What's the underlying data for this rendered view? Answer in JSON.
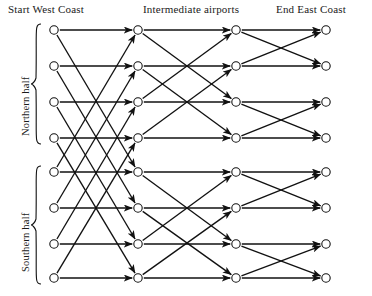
{
  "figure": {
    "kind": "butterfly-network-diagram",
    "column_titles": {
      "start": "Start West Coast",
      "intermediate": "Intermediate airports",
      "end": "End East Coast"
    },
    "side_labels": {
      "north": "Northern half",
      "south": "Southern half"
    },
    "colors": {
      "line": "#111111",
      "node_fill": "#ffffff",
      "background": "#ffffff",
      "text": "#1a1a1a"
    }
  },
  "network": {
    "columns": 4,
    "rows": 8,
    "column_x": [
      54,
      138,
      236,
      326
    ],
    "row_y": [
      30,
      66,
      102,
      138,
      172,
      208,
      244,
      278
    ],
    "node_radius": 4.2,
    "stages": [
      {
        "name": "stage-1",
        "span": 4,
        "edges": [
          [
            0,
            0
          ],
          [
            0,
            4
          ],
          [
            1,
            1
          ],
          [
            1,
            5
          ],
          [
            2,
            2
          ],
          [
            2,
            6
          ],
          [
            3,
            3
          ],
          [
            3,
            7
          ],
          [
            4,
            4
          ],
          [
            4,
            0
          ],
          [
            5,
            5
          ],
          [
            5,
            1
          ],
          [
            6,
            6
          ],
          [
            6,
            2
          ],
          [
            7,
            7
          ],
          [
            7,
            3
          ]
        ]
      },
      {
        "name": "stage-2",
        "span": 2,
        "edges": [
          [
            0,
            0
          ],
          [
            0,
            2
          ],
          [
            1,
            1
          ],
          [
            1,
            3
          ],
          [
            2,
            2
          ],
          [
            2,
            0
          ],
          [
            3,
            3
          ],
          [
            3,
            1
          ],
          [
            4,
            4
          ],
          [
            4,
            6
          ],
          [
            5,
            5
          ],
          [
            5,
            7
          ],
          [
            6,
            6
          ],
          [
            6,
            4
          ],
          [
            7,
            7
          ],
          [
            7,
            5
          ]
        ]
      },
      {
        "name": "stage-3",
        "span": 1,
        "edges": [
          [
            0,
            0
          ],
          [
            0,
            1
          ],
          [
            1,
            1
          ],
          [
            1,
            0
          ],
          [
            2,
            2
          ],
          [
            2,
            3
          ],
          [
            3,
            3
          ],
          [
            3,
            2
          ],
          [
            4,
            4
          ],
          [
            4,
            5
          ],
          [
            5,
            5
          ],
          [
            5,
            4
          ],
          [
            6,
            6
          ],
          [
            6,
            7
          ],
          [
            7,
            7
          ],
          [
            7,
            6
          ]
        ]
      }
    ],
    "braces": [
      {
        "name": "northern-half-brace",
        "rows": [
          0,
          3
        ]
      },
      {
        "name": "southern-half-brace",
        "rows": [
          4,
          7
        ]
      }
    ]
  }
}
